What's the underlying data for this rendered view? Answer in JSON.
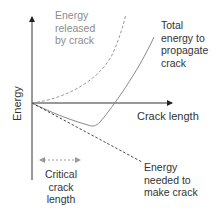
{
  "diagram": {
    "axes": {
      "y_label": "Energy",
      "x_label": "Crack length"
    },
    "curves": [
      {
        "id": "released",
        "label_lines": [
          "Energy",
          "released",
          "by crack"
        ],
        "style": "dashed",
        "color": "#9a9a9a"
      },
      {
        "id": "total",
        "label_lines": [
          "Total",
          "energy to",
          "propagate",
          "crack"
        ],
        "style": "solid",
        "color": "#8a8a8a"
      },
      {
        "id": "needed",
        "label_lines": [
          "Energy",
          "needed to",
          "make crack"
        ],
        "style": "dashed",
        "color": "#444444"
      }
    ],
    "annotation": {
      "label_lines": [
        "Critical",
        "crack",
        "length"
      ],
      "style": "dotted double arrow",
      "color": "#8c8c8c"
    }
  }
}
